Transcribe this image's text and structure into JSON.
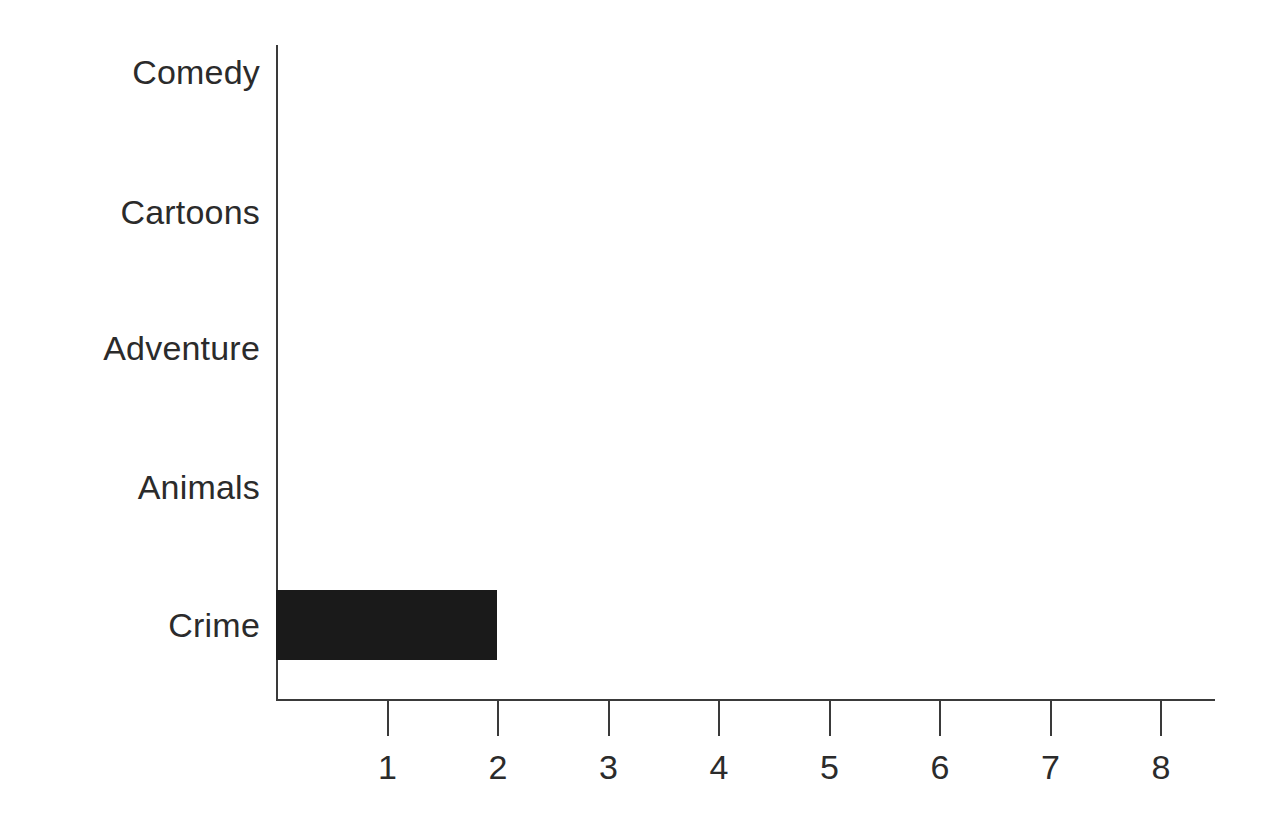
{
  "chart_data": {
    "type": "bar",
    "orientation": "horizontal",
    "title": "",
    "xlabel": "",
    "ylabel": "",
    "categories": [
      "Comedy",
      "Cartoons",
      "Adventure",
      "Animals",
      "Crime"
    ],
    "values": [
      0,
      0,
      0,
      0,
      2
    ],
    "xlim": [
      0,
      8.5
    ],
    "xticks": [
      1,
      2,
      3,
      4,
      5,
      6,
      7,
      8
    ],
    "xtick_labels": [
      "1",
      "2",
      "3",
      "4",
      "5",
      "6",
      "7",
      "8"
    ],
    "grid": false,
    "legend": false,
    "bar_color": "#1a1a1a",
    "axis_color": "#3a3a3a",
    "background": "#ffffff",
    "text_color": "#2b2b2b"
  },
  "geometry": {
    "axis_x": 276,
    "axis_top": 45,
    "baseline_y": 699,
    "axis_right": 1215,
    "unit_px": 110.5,
    "bar_height": 70,
    "category_y": [
      72,
      212,
      348,
      487,
      625
    ]
  }
}
